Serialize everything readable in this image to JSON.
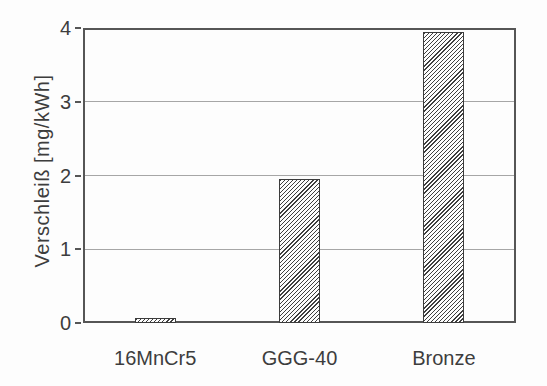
{
  "chart_data": {
    "type": "bar",
    "categories": [
      "16MnCr5",
      "GGG-40",
      "Bronze"
    ],
    "values": [
      0.07,
      1.95,
      3.95
    ],
    "title": "",
    "xlabel": "",
    "ylabel": "Verschleiß [mg/kWh]",
    "ylim": [
      0,
      4
    ],
    "yticks": [
      0,
      1,
      2,
      3,
      4
    ],
    "ytick_labels": [
      "0",
      "1",
      "2",
      "3",
      "4"
    ],
    "gridline_values": [
      1,
      2,
      3
    ],
    "legend": null,
    "bar_style": "white fill with dark diagonal hatch (/), dark outline",
    "colors": {
      "frame": "#565656",
      "grid": "#a6a6a6",
      "text": "#3d3d3d",
      "hatch": "#3f3f3f",
      "background": "#fdfdfd"
    }
  }
}
